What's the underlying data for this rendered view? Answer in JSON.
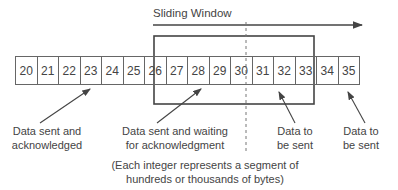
{
  "diagram": {
    "title": "Sliding Window",
    "segments": [
      "20",
      "21",
      "22",
      "23",
      "24",
      "25",
      "26",
      "27",
      "28",
      "29",
      "30",
      "31",
      "32",
      "33",
      "34",
      "35"
    ],
    "window": {
      "start": "26",
      "end": "32",
      "divider_after": "29"
    },
    "labels": {
      "acked_line1": "Data sent and",
      "acked_line2": "acknowledged",
      "waiting_line1": "Data sent and waiting",
      "waiting_line2": "for acknowledgment",
      "tosend_in_line1": "Data to",
      "tosend_in_line2": "be sent",
      "tosend_out_line1": "Data to",
      "tosend_out_line2": "be sent"
    },
    "note_line1": "(Each integer represents a segment of",
    "note_line2": "hundreds or thousands of bytes)",
    "colors": {
      "line": "#444444",
      "text": "#444444",
      "background": "#ffffff"
    }
  }
}
